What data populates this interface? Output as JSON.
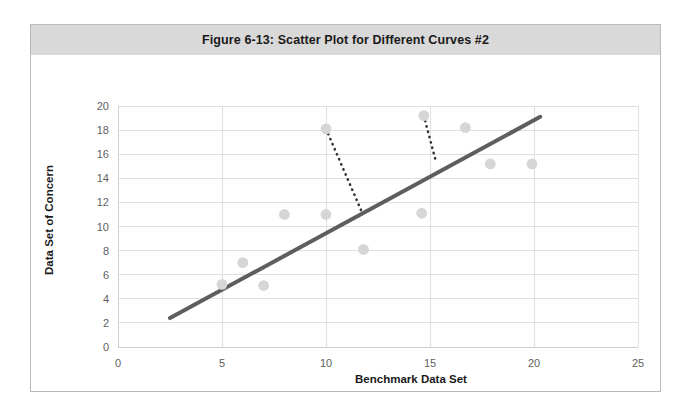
{
  "figure": {
    "title": "Figure 6-13: Scatter Plot for Different Curves #2",
    "title_band_color": "#d9d9d9",
    "border_color": "#b9b9b9"
  },
  "colors": {
    "scatter_marker": "#d6d6d6",
    "trend_line": "#5e5e5e",
    "connector_line": "#333333",
    "gridline": "#e0e0e0",
    "tick_text": "#5f5f5f",
    "axis_title_text": "#1a1a1a"
  },
  "chart_data": {
    "type": "scatter",
    "title": "Figure 6-13: Scatter Plot for Different Curves #2",
    "xlabel": "Benchmark Data Set",
    "ylabel": "Data Set of Concern",
    "xlim": [
      0,
      25
    ],
    "ylim": [
      0,
      20
    ],
    "xticks": [
      0,
      5,
      10,
      15,
      20,
      25
    ],
    "yticks": [
      0,
      2,
      4,
      6,
      8,
      10,
      12,
      14,
      16,
      18,
      20
    ],
    "grid": "horizontal-and-vertical",
    "legend": "none",
    "series": [
      {
        "name": "Observations",
        "marker": "circle",
        "points": [
          {
            "x": 5.0,
            "y": 5.2
          },
          {
            "x": 6.0,
            "y": 7.0
          },
          {
            "x": 7.0,
            "y": 5.1
          },
          {
            "x": 8.0,
            "y": 11.0
          },
          {
            "x": 10.0,
            "y": 11.0
          },
          {
            "x": 10.0,
            "y": 18.1
          },
          {
            "x": 11.8,
            "y": 8.1
          },
          {
            "x": 14.6,
            "y": 11.1
          },
          {
            "x": 14.7,
            "y": 19.2
          },
          {
            "x": 16.7,
            "y": 18.2
          },
          {
            "x": 17.9,
            "y": 15.2
          },
          {
            "x": 19.9,
            "y": 15.2
          }
        ]
      }
    ],
    "trend_line": {
      "name": "Fitted trend line",
      "style": "solid",
      "x0": 2.5,
      "y0": 2.4,
      "x1": 20.3,
      "y1": 19.1
    },
    "connectors": [
      {
        "name": "residual-drop-1",
        "style": "dotted",
        "x0": 10.0,
        "y0": 18.1,
        "x1": 11.7,
        "y1": 11.3
      },
      {
        "name": "residual-drop-2",
        "style": "dotted",
        "x0": 14.7,
        "y0": 19.2,
        "x1": 15.3,
        "y1": 15.3
      }
    ]
  }
}
